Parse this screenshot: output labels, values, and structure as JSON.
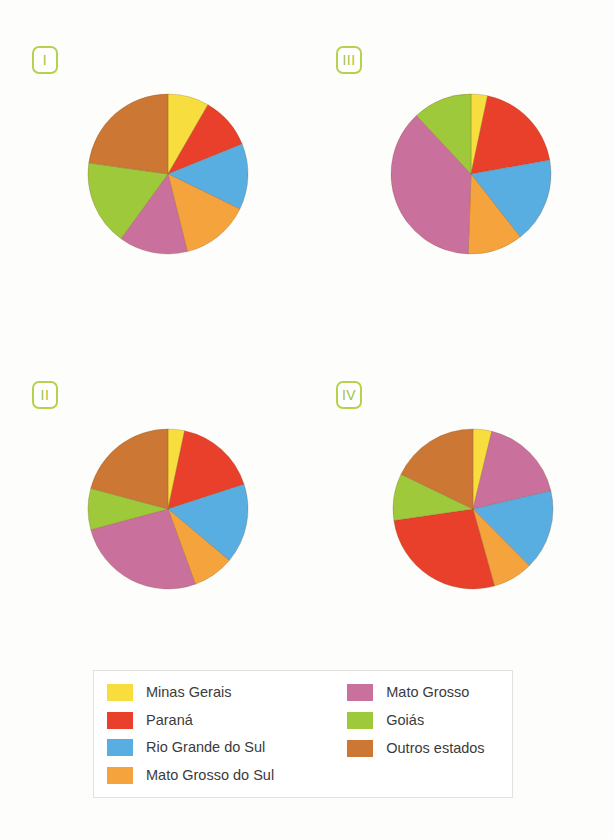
{
  "top_caption": "",
  "credit": "ID/BR",
  "palette": {
    "minas_gerais": "#f7de3e",
    "parana": "#e8402a",
    "rio_grande_do_sul": "#58aee0",
    "mato_grosso_do_sul": "#f5a33c",
    "mato_grosso": "#c9709c",
    "goias": "#9ec93a",
    "outros_estados": "#cc7733"
  },
  "legend": {
    "left_column": [
      {
        "label": "Minas Gerais",
        "color_key": "minas_gerais"
      },
      {
        "label": "Paraná",
        "color_key": "parana"
      },
      {
        "label": "Rio Grande do Sul",
        "color_key": "rio_grande_do_sul"
      },
      {
        "label": "Mato Grosso do Sul",
        "color_key": "mato_grosso_do_sul"
      }
    ],
    "right_column": [
      {
        "label": "Mato Grosso",
        "color_key": "mato_grosso"
      },
      {
        "label": "Goiás",
        "color_key": "goias"
      },
      {
        "label": "Outros estados",
        "color_key": "outros_estados"
      }
    ]
  },
  "badges": [
    {
      "id": "i",
      "label": "I"
    },
    {
      "id": "ii",
      "label": "II"
    },
    {
      "id": "iii",
      "label": "III"
    },
    {
      "id": "iv",
      "label": "IV"
    }
  ],
  "chart_data": [
    {
      "type": "pie",
      "id": "I",
      "title": "I",
      "labels": [
        "Minas Gerais",
        "Paraná",
        "Rio Grande do Sul",
        "Mato Grosso do Sul",
        "Mato Grosso",
        "Goiás",
        "Outros estados"
      ],
      "values": [
        8.3,
        10.6,
        13.3,
        13.9,
        13.9,
        17.2,
        22.8
      ],
      "angles_deg": [
        30,
        38,
        48,
        50,
        50,
        62,
        82
      ],
      "colors": [
        "#f7de3e",
        "#e8402a",
        "#58aee0",
        "#f5a33c",
        "#c9709c",
        "#9ec93a",
        "#cc7733"
      ],
      "start_angle_deg": 0,
      "direction": "clockwise",
      "radius_px": 80
    },
    {
      "type": "pie",
      "id": "II",
      "title": "II",
      "labels": [
        "Minas Gerais",
        "Paraná",
        "Rio Grande do Sul",
        "Mato Grosso do Sul",
        "Mato Grosso",
        "Goiás",
        "Outros estados"
      ],
      "values": [
        3.3,
        16.7,
        16.1,
        8.3,
        26.4,
        8.3,
        20.9
      ],
      "angles_deg": [
        12,
        60,
        58,
        30,
        95,
        30,
        75
      ],
      "colors": [
        "#f7de3e",
        "#e8402a",
        "#58aee0",
        "#f5a33c",
        "#c9709c",
        "#9ec93a",
        "#cc7733"
      ],
      "start_angle_deg": 0,
      "direction": "clockwise",
      "radius_px": 80
    },
    {
      "type": "pie",
      "id": "III",
      "title": "III",
      "labels": [
        "Minas Gerais",
        "Paraná",
        "Rio Grande do Sul",
        "Mato Grosso do Sul",
        "Mato Grosso",
        "Goiás",
        "Outros estados"
      ],
      "values": [
        3.3,
        18.9,
        17.2,
        11.1,
        37.5,
        12.0,
        0
      ],
      "angles_deg": [
        12,
        68,
        62,
        40,
        135,
        43,
        0
      ],
      "colors": [
        "#f7de3e",
        "#e8402a",
        "#58aee0",
        "#f5a33c",
        "#c9709c",
        "#9ec93a",
        "#cc7733"
      ],
      "start_angle_deg": 0,
      "direction": "clockwise",
      "radius_px": 80
    },
    {
      "type": "pie",
      "id": "IV",
      "title": "IV",
      "labels": [
        "Minas Gerais",
        "Mato Grosso",
        "Rio Grande do Sul",
        "Mato Grosso do Sul",
        "Paraná",
        "Goiás",
        "Outros estados"
      ],
      "values": [
        3.9,
        18.1,
        16.7,
        8.3,
        27.8,
        9.7,
        18.3
      ],
      "angles_deg": [
        14,
        65,
        60,
        30,
        100,
        35,
        66
      ],
      "colors": [
        "#f7de3e",
        "#c9709c",
        "#58aee0",
        "#f5a33c",
        "#e8402a",
        "#9ec93a",
        "#cc7733"
      ],
      "start_angle_deg": 0,
      "direction": "clockwise",
      "radius_px": 80
    }
  ]
}
